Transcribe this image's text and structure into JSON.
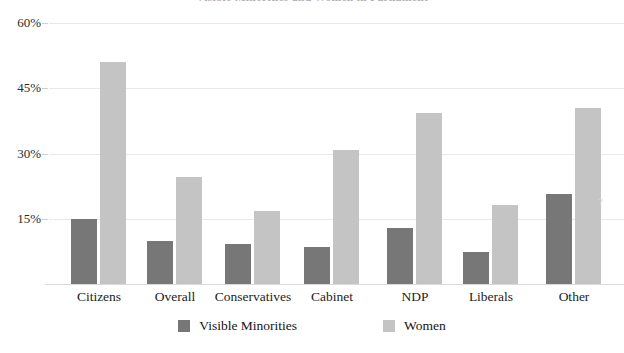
{
  "chart_data": {
    "type": "bar",
    "title": "Visible Minorities and Women in Parliament",
    "xlabel": "",
    "ylabel": "",
    "ylim": [
      0,
      63.5
    ],
    "grid": true,
    "legend_position": "bottom-center",
    "ytick_labels": [
      "60%",
      "45%",
      "30%",
      "15%"
    ],
    "ytick_values": [
      60,
      45,
      30,
      15
    ],
    "categories": [
      "Citizens",
      "Overall",
      "Conservatives",
      "Cabinet",
      "NDP",
      "Liberals",
      "Other"
    ],
    "series": [
      {
        "name": "Visible Minorities",
        "color": "#777777",
        "values": [
          15.0,
          10.0,
          9.3,
          8.6,
          12.9,
          7.3,
          20.6
        ]
      },
      {
        "name": "Women",
        "color": "#c4c4c4",
        "values": [
          51.0,
          24.6,
          16.9,
          30.9,
          39.4,
          18.1,
          40.6
        ]
      }
    ]
  },
  "watermark": "?",
  "axis": {
    "ytick_dash_color": "#cfcfcf",
    "gridline_color": "#e9e9e9",
    "baseline_color": "#d9d9d9"
  }
}
